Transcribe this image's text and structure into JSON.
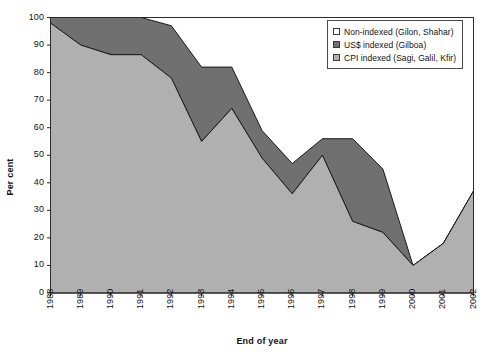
{
  "chart_data": {
    "type": "area",
    "title": "",
    "xlabel": "End of year",
    "ylabel": "Per cent",
    "stacked": true,
    "grid": false,
    "legend_position": "top-right",
    "categories": [
      "1988",
      "1989",
      "1990",
      "1991",
      "1992",
      "1993",
      "1994",
      "1995",
      "1996",
      "1997",
      "1998",
      "1999",
      "2000",
      "2001",
      "2002"
    ],
    "x": [
      1988,
      1989,
      1990,
      1991,
      1992,
      1993,
      1994,
      1995,
      1996,
      1997,
      1998,
      1999,
      2000,
      2001,
      2002
    ],
    "xlim": [
      1988,
      2002
    ],
    "ylim": [
      0,
      100
    ],
    "ytick_labels": [
      "0",
      "10",
      "20",
      "30",
      "40",
      "50",
      "60",
      "70",
      "80",
      "90",
      "100"
    ],
    "ytick_values": [
      0,
      10,
      20,
      30,
      40,
      50,
      60,
      70,
      80,
      90,
      100
    ],
    "series": [
      {
        "name": "CPI indexed (Sagi, Galil, Kfir)",
        "color": "#b0b0b0",
        "values": [
          98,
          90,
          86.5,
          86.5,
          78,
          55,
          67,
          49,
          36,
          50,
          26,
          22,
          10,
          18,
          37
        ]
      },
      {
        "name": "US$ indexed (Gilboa)",
        "color": "#707070",
        "values": [
          2,
          10,
          13.5,
          13.5,
          19,
          27,
          15,
          10,
          11,
          6,
          30,
          23,
          0,
          0,
          0
        ]
      },
      {
        "name": "Non-indexed (Gilon, Shahar)",
        "color": "#ffffff",
        "values": [
          0,
          0,
          0,
          0,
          0,
          18,
          18,
          41,
          53,
          44,
          44,
          55,
          90,
          82,
          63
        ]
      }
    ],
    "cumulative_cpi": [
      98,
      90,
      86.5,
      86.5,
      78,
      55,
      67,
      49,
      36,
      50,
      26,
      22,
      10,
      18,
      37
    ],
    "cumulative_cpi_plus_usd": [
      100,
      100,
      100,
      100,
      97,
      82,
      82,
      59,
      47,
      56,
      56,
      45,
      10,
      18,
      37
    ]
  },
  "legend": {
    "items": [
      {
        "label": "Non-indexed (Gilon, Shahar)",
        "swatch": "#ffffff"
      },
      {
        "label": "US$ indexed (Gilboa)",
        "swatch": "#707070"
      },
      {
        "label": "CPI indexed (Sagi, Galil, Kfir)",
        "swatch": "#b0b0b0"
      }
    ]
  },
  "axes": {
    "y_title": "Per cent",
    "x_title": "End of year"
  }
}
